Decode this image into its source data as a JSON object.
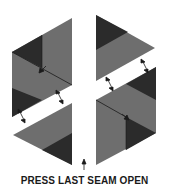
{
  "diagram": {
    "caption": "PRESS LAST SEAM OPEN",
    "colors": {
      "medium": "#6e6e6e",
      "dark": "#2b2b2b",
      "line": "#1a1a1a",
      "background": "#ffffff"
    },
    "pieces": [
      {
        "name": "upper-left-unit"
      },
      {
        "name": "lower-left-triangle"
      },
      {
        "name": "upper-right-triangle"
      },
      {
        "name": "lower-right-unit"
      }
    ],
    "arrows": [
      "press-arrow-ul",
      "join-arrow-left-a",
      "join-arrow-left-b",
      "join-arrow-right-a",
      "join-arrow-right-b",
      "press-arrow-lr",
      "last-seam-arrow"
    ]
  }
}
